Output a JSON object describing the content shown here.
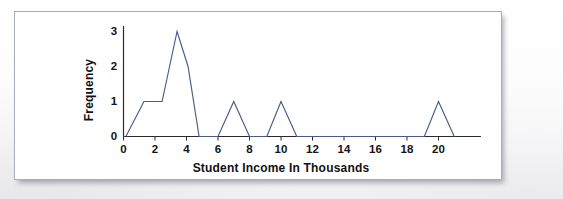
{
  "figure": {
    "kind": "frequency-polygon",
    "frame_border_color": "#a9adb6",
    "background_color": "#ffffff"
  },
  "chart_data": {
    "type": "line",
    "title": "",
    "subtitle": "",
    "xlabel": "Student Income In Thousands",
    "ylabel": "Frequency",
    "xlim": [
      0,
      22.5
    ],
    "ylim": [
      0,
      3.35
    ],
    "grid": false,
    "legend": false,
    "legend_position": "none",
    "x_ticks": [
      0,
      2,
      4,
      6,
      8,
      10,
      12,
      14,
      16,
      18,
      20
    ],
    "x_tick_labels": [
      "0",
      "2",
      "4",
      "6",
      "8",
      "10",
      "12",
      "14",
      "16",
      "18",
      "20"
    ],
    "y_ticks": [
      0,
      1,
      2,
      3
    ],
    "y_tick_labels": [
      "0",
      "1",
      "2",
      "3"
    ],
    "line_color": "#4a5a8c",
    "series": [
      {
        "name": "Frequency of student income",
        "points": [
          {
            "x": 0.15,
            "y": 0
          },
          {
            "x": 1.3,
            "y": 1
          },
          {
            "x": 2.45,
            "y": 1
          },
          {
            "x": 3.4,
            "y": 3
          },
          {
            "x": 4.1,
            "y": 2
          },
          {
            "x": 4.8,
            "y": 0
          },
          {
            "x": 6.0,
            "y": 0
          },
          {
            "x": 7.0,
            "y": 1
          },
          {
            "x": 8.0,
            "y": 0
          },
          {
            "x": 9.1,
            "y": 0
          },
          {
            "x": 10.0,
            "y": 1
          },
          {
            "x": 11.0,
            "y": 0
          },
          {
            "x": 19.1,
            "y": 0
          },
          {
            "x": 20.0,
            "y": 1
          },
          {
            "x": 21.0,
            "y": 0
          }
        ]
      }
    ],
    "peaks": [
      {
        "x": 3.4,
        "y": 3,
        "label": "3"
      },
      {
        "x": 7.0,
        "y": 1,
        "label": "1"
      },
      {
        "x": 10.0,
        "y": 1,
        "label": "1"
      },
      {
        "x": 20.0,
        "y": 1,
        "label": "1"
      }
    ]
  }
}
